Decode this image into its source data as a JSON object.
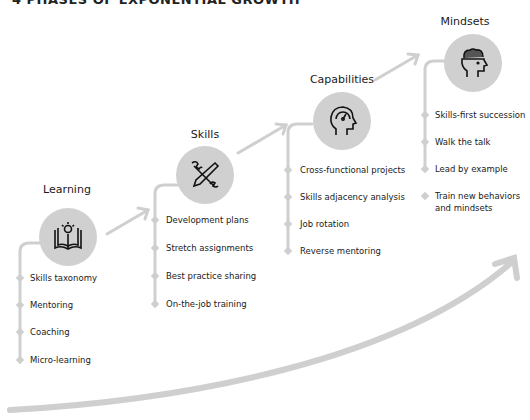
{
  "title": "4 PHASES OF EXPONENTIAL GROWTH",
  "stages": [
    {
      "title": "Learning",
      "icon": "open-book-lightbulb-icon",
      "items": [
        "Skills taxonomy",
        "Mentoring",
        "Coaching",
        "Micro-learning"
      ]
    },
    {
      "title": "Skills",
      "icon": "wrench-pencil-icon",
      "items": [
        "Development plans",
        "Stretch assignments",
        "Best practice sharing",
        "On-the-job training"
      ]
    },
    {
      "title": "Capabilities",
      "icon": "head-gauge-icon",
      "items": [
        "Cross-functional projects",
        "Skills adjacency analysis",
        "Job rotation",
        "Reverse mentoring"
      ]
    },
    {
      "title": "Mindsets",
      "icon": "head-brain-icon",
      "items": [
        "Skills-first succession",
        "Walk the talk",
        "Lead by example",
        "Train new behaviors",
        "and mindsets"
      ]
    }
  ],
  "colors": {
    "accent": "#cfcfcf",
    "circle": "#d0d0d0",
    "text": "#1a1a1a"
  }
}
